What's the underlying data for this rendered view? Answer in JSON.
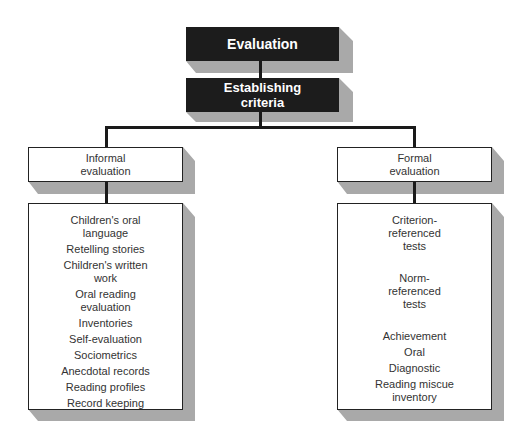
{
  "diagram": {
    "root": {
      "label": "Evaluation"
    },
    "second": {
      "label": "Establishing\ncriteria"
    },
    "branches": [
      {
        "label": "Informal\nevaluation",
        "items": [
          "Children's oral\nlanguage",
          "Retelling stories",
          "Children's written\nwork",
          "Oral reading\nevaluation",
          "Inventories",
          "Self-evaluation",
          "Sociometrics",
          "Anecdotal records",
          "Reading profiles",
          "Record keeping"
        ]
      },
      {
        "label": "Formal\nevaluation",
        "items": [
          "Criterion-\nreferenced\ntests",
          "Norm-\nreferenced\ntests",
          "Achievement",
          "Oral",
          "Diagnostic",
          "Reading miscue\ninventory"
        ]
      }
    ]
  },
  "colors": {
    "dark_box": "#1c1c1c",
    "shadow": "#a9a9a9",
    "line": "#1a1a1a"
  }
}
